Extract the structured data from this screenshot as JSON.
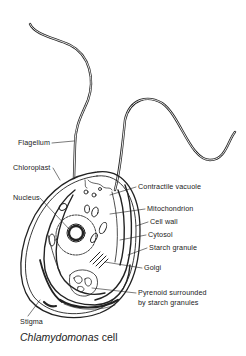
{
  "figure": {
    "caption_species": "Chlamydomonas",
    "caption_suffix": " cell"
  },
  "labels": {
    "flagellum": "Flagellum",
    "chloroplast": "Chloroplast",
    "nucleus": "Nucleus",
    "contractile_vacuole": "Contractile vacuole",
    "mitochondrion": "Mitochondrion",
    "cell_wall": "Cell wall",
    "cytosol": "Cytosol",
    "starch_granule": "Starch granule",
    "golgi": "Golgi",
    "pyrenoid_line1": "Pyrenoid surrounded",
    "pyrenoid_line2": "by starch granules",
    "stigma": "Stigma"
  },
  "colors": {
    "ink": "#222222",
    "background": "#ffffff"
  }
}
